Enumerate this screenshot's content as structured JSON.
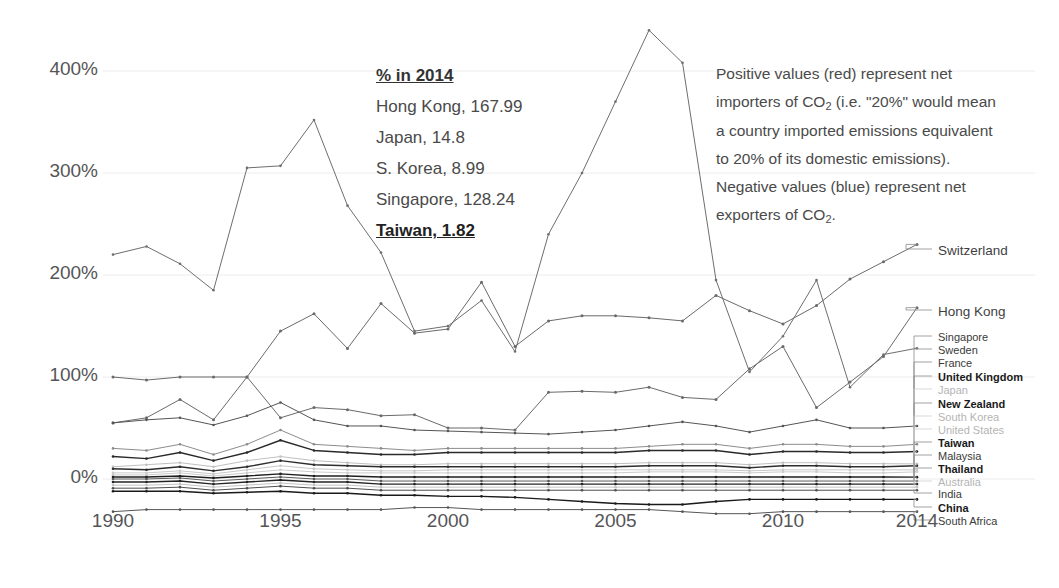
{
  "chart_data": {
    "type": "line",
    "title": "",
    "subtitle": "",
    "xlabel": "",
    "ylabel": "",
    "xlim": [
      1990,
      2014
    ],
    "ylim": [
      -50,
      450
    ],
    "grid": true,
    "y_tick_labels": [
      "400%",
      "300%",
      "200%",
      "100%",
      "0%"
    ],
    "y_tick_values": [
      400,
      300,
      200,
      100,
      0
    ],
    "x_tick_labels": [
      "1990",
      "1995",
      "2000",
      "2005",
      "2010",
      "2014"
    ],
    "x_tick_values": [
      1990,
      1995,
      2000,
      2005,
      2010,
      2014
    ],
    "x": [
      1990,
      1991,
      1992,
      1993,
      1994,
      1995,
      1996,
      1997,
      1998,
      1999,
      2000,
      2001,
      2002,
      2003,
      2004,
      2005,
      2006,
      2007,
      2008,
      2009,
      2010,
      2011,
      2012,
      2013,
      2014
    ],
    "legend_position": "right-inline",
    "series": [
      {
        "name": "Singapore",
        "label": "Singapore",
        "style": "normal",
        "color": "#6e6e6e",
        "label_y": 332,
        "values": [
          220,
          228,
          211,
          185,
          305,
          307,
          352,
          268,
          222,
          145,
          150,
          175,
          125,
          240,
          300,
          370,
          440,
          408,
          195,
          105,
          140,
          195,
          90,
          122,
          128.24
        ]
      },
      {
        "name": "Switzerland",
        "label": "Switzerland",
        "style": "big",
        "color": "#6a6a6a",
        "label_y": 245,
        "values": [
          100,
          97,
          100,
          100,
          100,
          145,
          162,
          128,
          172,
          143,
          147,
          193,
          130,
          155,
          160,
          160,
          158,
          155,
          180,
          165,
          152,
          170,
          196,
          213,
          230
        ]
      },
      {
        "name": "Hong Kong",
        "label": "Hong Kong",
        "style": "big",
        "color": "#6a6a6a",
        "label_y": 306,
        "values": [
          55,
          60,
          78,
          58,
          100,
          60,
          70,
          68,
          62,
          63,
          50,
          50,
          48,
          85,
          86,
          85,
          90,
          80,
          78,
          108,
          130,
          70,
          95,
          120,
          167.99
        ]
      },
      {
        "name": "Sweden",
        "label": "Sweden",
        "style": "normal",
        "color": "#555555",
        "label_y": 345,
        "values": [
          55,
          58,
          60,
          53,
          62,
          75,
          58,
          52,
          52,
          48,
          47,
          46,
          45,
          44,
          46,
          48,
          52,
          56,
          52,
          46,
          52,
          58,
          50,
          50,
          52
        ]
      },
      {
        "name": "France",
        "label": "France",
        "style": "normal",
        "color": "#8c8c8c",
        "label_y": 358,
        "values": [
          30,
          28,
          34,
          24,
          34,
          48,
          34,
          32,
          30,
          28,
          30,
          30,
          30,
          30,
          30,
          30,
          32,
          34,
          34,
          30,
          34,
          34,
          32,
          32,
          34
        ]
      },
      {
        "name": "United Kingdom",
        "label": "United Kingdom",
        "style": "bold",
        "color": "#2a2a2a",
        "label_y": 372,
        "values": [
          22,
          20,
          26,
          18,
          26,
          38,
          28,
          26,
          24,
          24,
          26,
          26,
          26,
          26,
          26,
          26,
          28,
          28,
          28,
          24,
          27,
          27,
          26,
          26,
          27
        ]
      },
      {
        "name": "Japan",
        "label": "Japan",
        "style": "faded",
        "color": "#c0c0c0",
        "label_y": 385,
        "values": [
          12,
          14,
          16,
          12,
          18,
          22,
          18,
          16,
          14,
          14,
          15,
          15,
          15,
          15,
          15,
          15,
          16,
          16,
          16,
          14,
          16,
          16,
          15,
          15,
          14.8
        ]
      },
      {
        "name": "New Zealand",
        "label": "New Zealand",
        "style": "bold",
        "color": "#2e2e2e",
        "label_y": 399,
        "values": [
          10,
          9,
          12,
          8,
          12,
          18,
          14,
          13,
          12,
          12,
          12,
          12,
          12,
          12,
          12,
          12,
          13,
          13,
          13,
          11,
          13,
          13,
          12,
          12,
          13
        ]
      },
      {
        "name": "South Korea",
        "label": "South Korea",
        "style": "faded",
        "color": "#c8c8c8",
        "label_y": 412,
        "values": [
          6,
          6,
          8,
          5,
          9,
          13,
          10,
          9,
          8,
          8,
          9,
          9,
          9,
          9,
          9,
          9,
          9,
          9,
          9,
          8,
          9,
          9,
          9,
          9,
          8.99
        ]
      },
      {
        "name": "United States",
        "label": "United States",
        "style": "faded",
        "color": "#cccccc",
        "label_y": 425,
        "values": [
          4,
          4,
          6,
          3,
          6,
          9,
          7,
          6,
          6,
          6,
          6,
          6,
          6,
          6,
          6,
          6,
          7,
          7,
          7,
          6,
          7,
          7,
          6,
          6,
          7
        ]
      },
      {
        "name": "Taiwan",
        "label": "Taiwan",
        "style": "bold",
        "color": "#1f1f1f",
        "label_y": 438,
        "values": [
          2,
          2,
          3,
          1,
          3,
          5,
          3,
          3,
          2,
          2,
          2,
          2,
          2,
          2,
          2,
          2,
          2,
          2,
          2,
          2,
          2,
          2,
          2,
          2,
          1.82
        ]
      },
      {
        "name": "Malaysia",
        "label": "Malaysia",
        "style": "normal",
        "color": "#5a5a5a",
        "label_y": 451,
        "values": [
          0,
          0,
          1,
          -2,
          0,
          2,
          0,
          0,
          -2,
          -2,
          -2,
          -2,
          -2,
          -2,
          -2,
          -2,
          -2,
          -2,
          -2,
          -2,
          -2,
          -2,
          -2,
          -2,
          -2
        ]
      },
      {
        "name": "Thailand",
        "label": "Thailand",
        "style": "bold",
        "color": "#242424",
        "label_y": 464,
        "values": [
          -3,
          -3,
          -2,
          -5,
          -3,
          -1,
          -3,
          -3,
          -5,
          -5,
          -5,
          -5,
          -5,
          -5,
          -5,
          -5,
          -5,
          -5,
          -5,
          -5,
          -5,
          -5,
          -5,
          -5,
          -5
        ]
      },
      {
        "name": "Australia",
        "label": "Australia",
        "style": "faded",
        "color": "#c2c2c2",
        "label_y": 477,
        "values": [
          -6,
          -6,
          -5,
          -8,
          -6,
          -4,
          -6,
          -6,
          -8,
          -8,
          -8,
          -8,
          -8,
          -8,
          -8,
          -8,
          -8,
          -8,
          -8,
          -8,
          -8,
          -8,
          -8,
          -8,
          -8
        ]
      },
      {
        "name": "India",
        "label": "India",
        "style": "normal",
        "color": "#4e4e4e",
        "label_y": 489,
        "values": [
          -9,
          -9,
          -8,
          -11,
          -9,
          -7,
          -9,
          -9,
          -11,
          -11,
          -11,
          -11,
          -11,
          -11,
          -11,
          -11,
          -11,
          -11,
          -11,
          -11,
          -11,
          -11,
          -11,
          -11,
          -11
        ]
      },
      {
        "name": "China",
        "label": "China",
        "style": "bold",
        "color": "#1a1a1a",
        "label_y": 503,
        "values": [
          -12,
          -12,
          -12,
          -14,
          -13,
          -12,
          -14,
          -14,
          -16,
          -16,
          -17,
          -17,
          -18,
          -20,
          -22,
          -24,
          -25,
          -25,
          -22,
          -20,
          -20,
          -20,
          -20,
          -20,
          -20
        ]
      },
      {
        "name": "South Africa",
        "label": "South Africa",
        "style": "normal",
        "color": "#555555",
        "label_y": 516,
        "values": [
          -32,
          -30,
          -30,
          -30,
          -30,
          -30,
          -30,
          -30,
          -30,
          -28,
          -28,
          -30,
          -30,
          -30,
          -30,
          -30,
          -30,
          -32,
          -34,
          -34,
          -32,
          -32,
          -32,
          -32,
          -32
        ]
      }
    ]
  },
  "callout": {
    "heading": "% in 2014",
    "lines": [
      "Hong Kong, 167.99",
      "Japan, 14.8",
      "S. Korea, 8.99",
      "Singapore, 128.24"
    ],
    "highlight": "Taiwan, 1.82"
  },
  "note": {
    "part1": "Positive values (red) represent net importers of CO",
    "sub1": "2",
    "part2": " (i.e. \"20%\" would mean a country imported emissions equivalent to 20% of its domestic emissions). Negative values (blue) represent net exporters of CO",
    "sub2": "2",
    "part3": "."
  }
}
